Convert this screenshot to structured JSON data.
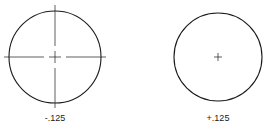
{
  "diagram": {
    "figures": [
      {
        "id": "left",
        "label": "-.125",
        "center_mark": "crosshair-with-extended-lines",
        "cx": 55,
        "cy": 57,
        "r": 46
      },
      {
        "id": "right",
        "label": "+.125",
        "center_mark": "small-plus",
        "cx": 218,
        "cy": 57,
        "r": 44
      }
    ],
    "colors": {
      "stroke": "#1a1a1a",
      "background": "#ffffff"
    }
  }
}
